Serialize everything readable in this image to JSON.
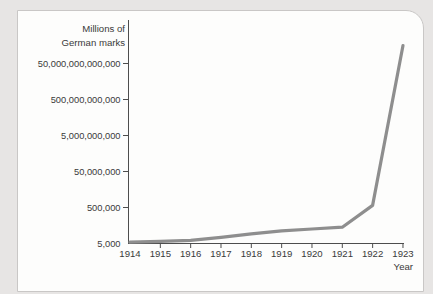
{
  "page": {
    "background_color": "#e7e5e4",
    "card_background": "#fdfdfc",
    "card_border_color": "#c9c7c6"
  },
  "chart_data": {
    "type": "line",
    "scale_y": "log",
    "title": "Millions of German marks",
    "ylabel_lines": [
      "Millions of",
      "German marks"
    ],
    "xlabel": "Year",
    "x": [
      1914,
      1915,
      1916,
      1917,
      1918,
      1919,
      1920,
      1921,
      1922,
      1923
    ],
    "values": [
      6000,
      6500,
      7500,
      11000,
      17000,
      25000,
      32000,
      40000,
      650000,
      500000000000000
    ],
    "series": [
      {
        "name": "Currency in circulation (millions of German marks)",
        "values": [
          6000,
          6500,
          7500,
          11000,
          17000,
          25000,
          32000,
          40000,
          650000,
          500000000000000
        ]
      }
    ],
    "yticks": [
      {
        "label": "50,000,000,000,000",
        "value": 50000000000000
      },
      {
        "label": "500,000,000,000",
        "value": 500000000000
      },
      {
        "label": "5,000,000,000",
        "value": 5000000000
      },
      {
        "label": "50,000,000",
        "value": 50000000
      },
      {
        "label": "500,000",
        "value": 500000
      },
      {
        "label": "5,000",
        "value": 5000
      }
    ],
    "ylim": [
      5000,
      500000000000000
    ],
    "grid": false,
    "legend": "none",
    "line_color": "#8e8e8e",
    "axis_color": "#4d4d4d",
    "text_color": "#3a3a3a"
  }
}
